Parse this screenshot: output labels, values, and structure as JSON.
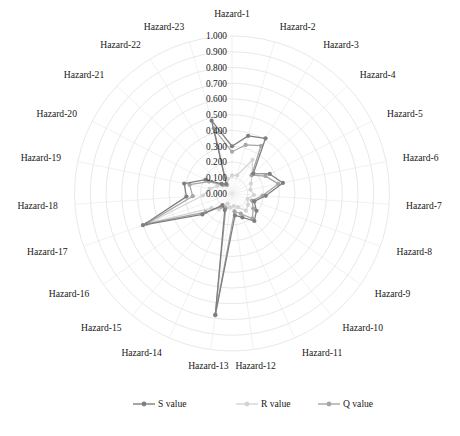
{
  "chart_data": {
    "type": "radar",
    "title": "",
    "subtitle": "",
    "xlabel": "",
    "ylabel": "",
    "grid": true,
    "legend_position": "bottom",
    "rlim": [
      0.0,
      1.0
    ],
    "rticks": [
      "1.000",
      "0.900",
      "0.800",
      "0.700",
      "0.600",
      "0.500",
      "0.400",
      "0.300",
      "0.200",
      "0.100",
      "0.000"
    ],
    "rtick_values": [
      1.0,
      0.9,
      0.8,
      0.7,
      0.6,
      0.5,
      0.4,
      0.3,
      0.2,
      0.1,
      0.0
    ],
    "categories": [
      "Hazard-1",
      "Hazard-2",
      "Hazard-3",
      "Hazard-4",
      "Hazard-5",
      "Hazard-6",
      "Hazard-7",
      "Hazard-8",
      "Hazard-9",
      "Hazard-10",
      "Hazard-11",
      "Hazard-12",
      "Hazard-13",
      "Hazard-14",
      "Hazard-15",
      "Hazard-16",
      "Hazard-17",
      "Hazard-18",
      "Hazard-19",
      "Hazard-20",
      "Hazard-21",
      "Hazard-22",
      "Hazard-23"
    ],
    "series": [
      {
        "name": "S value",
        "color": "#7f7f7f",
        "values": [
          0.3,
          0.38,
          0.41,
          0.185,
          0.27,
          0.33,
          0.215,
          0.15,
          0.19,
          0.225,
          0.165,
          0.14,
          0.78,
          0.115,
          0.095,
          0.23,
          0.6,
          0.29,
          0.31,
          0.19,
          0.09,
          0.07,
          0.48
        ]
      },
      {
        "name": "R value",
        "color": "#d4d4d4",
        "values": [
          0.115,
          0.12,
          0.25,
          0.175,
          0.135,
          0.12,
          0.14,
          0.105,
          0.125,
          0.14,
          0.095,
          0.08,
          0.09,
          0.07,
          0.13,
          0.16,
          0.56,
          0.185,
          0.145,
          0.105,
          0.075,
          0.06,
          0.095
        ]
      },
      {
        "name": "Q value",
        "color": "#a6a6a6",
        "values": [
          0.265,
          0.32,
          0.355,
          0.17,
          0.24,
          0.3,
          0.195,
          0.135,
          0.165,
          0.205,
          0.14,
          0.115,
          0.775,
          0.1,
          0.11,
          0.205,
          0.575,
          0.25,
          0.275,
          0.165,
          0.08,
          0.065,
          0.43
        ]
      }
    ]
  },
  "legend": {
    "items": [
      {
        "label": "S value",
        "color": "#7f7f7f"
      },
      {
        "label": "R value",
        "color": "#d4d4d4"
      },
      {
        "label": "Q value",
        "color": "#a6a6a6"
      }
    ]
  }
}
